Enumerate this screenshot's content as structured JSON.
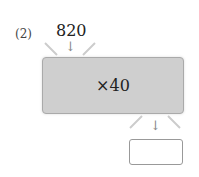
{
  "problem_label": "(2)",
  "input_value": "820",
  "operation": "×40",
  "answer_value": "",
  "arrow_glyph": "↓"
}
